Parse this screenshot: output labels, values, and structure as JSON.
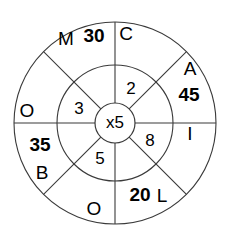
{
  "diagram": {
    "type": "multiplication-wheel",
    "title": "",
    "center_operation": "x5",
    "multiplier": 5,
    "geometry": {
      "center_x": 115,
      "center_y": 123,
      "outer_radius": 101,
      "middle_radius": 58,
      "hub_radius": 20
    },
    "colors": {
      "stroke": "#3a3a3a",
      "text": "#000000",
      "background": "#ffffff"
    },
    "hub": {
      "label": "x5"
    },
    "inner_ring": {
      "name": "inner-ring-numbers",
      "segments": [
        {
          "id": "inner-top-right",
          "label": "2",
          "angle_deg": 67.5,
          "value": 2
        },
        {
          "id": "inner-right",
          "label": "8",
          "angle_deg": -22.5,
          "value": 8
        },
        {
          "id": "inner-bottom",
          "label": "5",
          "angle_deg": -112.5,
          "value": 5
        },
        {
          "id": "inner-left",
          "label": "3",
          "angle_deg": 157.5,
          "value": 3
        }
      ]
    },
    "outer_ring": {
      "name": "outer-ring-answers",
      "segments": [
        {
          "id": "outer-top-right",
          "letter": "C",
          "number": "",
          "angle_deg": 67.5
        },
        {
          "id": "outer-right-upper",
          "letter": "A",
          "number": "45",
          "angle_deg": 27.0
        },
        {
          "id": "outer-right",
          "letter": "I",
          "number": "",
          "angle_deg": -17.0
        },
        {
          "id": "outer-bottom-right",
          "letter": "L",
          "number": "20",
          "angle_deg": -62.0
        },
        {
          "id": "outer-bottom",
          "letter": "O",
          "number": "",
          "angle_deg": -108.0
        },
        {
          "id": "outer-bottom-left",
          "letter": "B",
          "number": "35",
          "angle_deg": -153.0
        },
        {
          "id": "outer-left",
          "letter": "O",
          "number": "",
          "angle_deg": 163.0
        },
        {
          "id": "outer-top-left",
          "letter": "M",
          "number": "30",
          "angle_deg": 118.0
        }
      ]
    },
    "labels": {
      "hub": "x5",
      "inner_2": "2",
      "inner_8": "8",
      "inner_5": "5",
      "inner_3": "3",
      "letter_C": "C",
      "letter_A": "A",
      "number_45": "45",
      "letter_I": "I",
      "number_20": "20",
      "letter_L": "L",
      "letter_O_bottom": "O",
      "number_35": "35",
      "letter_B": "B",
      "letter_O_left": "O",
      "letter_M": "M",
      "number_30": "30"
    }
  }
}
